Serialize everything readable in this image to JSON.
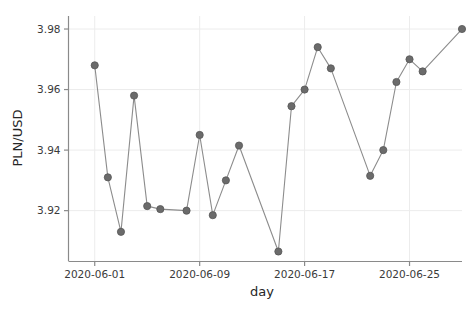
{
  "chart_data": {
    "type": "line",
    "title": "",
    "xlabel": "day",
    "ylabel": "PLN/USD",
    "grid": true,
    "legend": null,
    "marker": "filled-circle",
    "marker_color": "#6b6b6b",
    "line_color": "#8c8c8c",
    "xlim": [
      "2020-05-30",
      "2020-06-29"
    ],
    "ylim": [
      3.9032,
      3.9843
    ],
    "ytick_labels": [
      "3.92",
      "3.94",
      "3.96",
      "3.98"
    ],
    "ytick_values": [
      3.92,
      3.94,
      3.96,
      3.98
    ],
    "xtick_labels": [
      "2020-06-01",
      "2020-06-09",
      "2020-06-17",
      "2020-06-25"
    ],
    "xtick_values": [
      "2020-06-01",
      "2020-06-09",
      "2020-06-17",
      "2020-06-25"
    ],
    "x": [
      "2020-06-01",
      "2020-06-02",
      "2020-06-03",
      "2020-06-04",
      "2020-06-05",
      "2020-06-06",
      "2020-06-08",
      "2020-06-09",
      "2020-06-10",
      "2020-06-11",
      "2020-06-12",
      "2020-06-15",
      "2020-06-16",
      "2020-06-17",
      "2020-06-18",
      "2020-06-19",
      "2020-06-22",
      "2020-06-23",
      "2020-06-24",
      "2020-06-25",
      "2020-06-26",
      "2020-06-29"
    ],
    "values": [
      3.968,
      3.931,
      3.913,
      3.958,
      3.9215,
      3.9205,
      3.92,
      3.945,
      3.9185,
      3.93,
      3.9415,
      3.9065,
      3.9545,
      3.96,
      3.974,
      3.967,
      3.9315,
      3.94,
      3.9625,
      3.97,
      3.966,
      3.98
    ],
    "series": [
      {
        "name": "PLN/USD",
        "points": [
          {
            "x": "2020-06-01",
            "y": 3.968
          },
          {
            "x": "2020-06-02",
            "y": 3.931
          },
          {
            "x": "2020-06-03",
            "y": 3.913
          },
          {
            "x": "2020-06-04",
            "y": 3.958
          },
          {
            "x": "2020-06-05",
            "y": 3.9215
          },
          {
            "x": "2020-06-06",
            "y": 3.9205
          },
          {
            "x": "2020-06-08",
            "y": 3.92
          },
          {
            "x": "2020-06-09",
            "y": 3.945
          },
          {
            "x": "2020-06-10",
            "y": 3.9185
          },
          {
            "x": "2020-06-11",
            "y": 3.93
          },
          {
            "x": "2020-06-12",
            "y": 3.9415
          },
          {
            "x": "2020-06-15",
            "y": 3.9065
          },
          {
            "x": "2020-06-16",
            "y": 3.9545
          },
          {
            "x": "2020-06-17",
            "y": 3.96
          },
          {
            "x": "2020-06-18",
            "y": 3.974
          },
          {
            "x": "2020-06-19",
            "y": 3.967
          },
          {
            "x": "2020-06-22",
            "y": 3.9315
          },
          {
            "x": "2020-06-23",
            "y": 3.94
          },
          {
            "x": "2020-06-24",
            "y": 3.9625
          },
          {
            "x": "2020-06-25",
            "y": 3.97
          },
          {
            "x": "2020-06-26",
            "y": 3.966
          },
          {
            "x": "2020-06-29",
            "y": 3.98
          }
        ]
      }
    ]
  },
  "colors": {
    "background": "#ffffff",
    "grid": "#ececec",
    "axis": "#8a8a8a",
    "marker": "#6b6b6b",
    "line": "#8c8c8c",
    "text": "#333333"
  }
}
